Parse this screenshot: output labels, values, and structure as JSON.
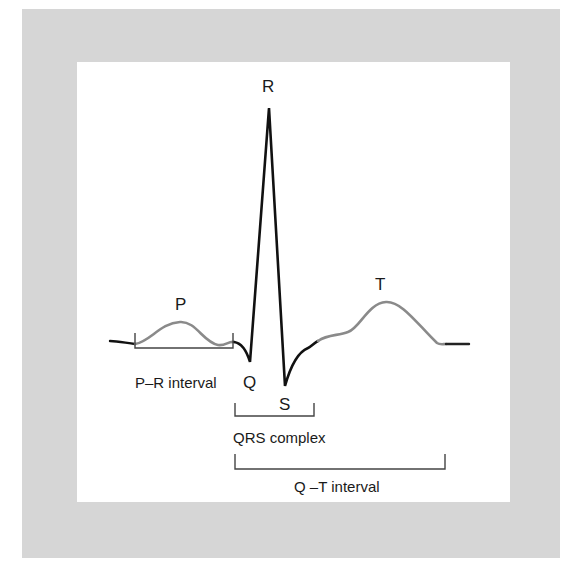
{
  "figure": {
    "colors": {
      "frame": "#d6d6d6",
      "panel": "#ffffff",
      "trace_dark": "#111111",
      "trace_gray": "#8a8a8a",
      "bracket": "#444444",
      "text": "#1a1a1a"
    }
  },
  "waves": {
    "p": "P",
    "q": "Q",
    "r": "R",
    "s": "S",
    "t": "T"
  },
  "intervals": {
    "pr": "P–R interval",
    "qrs": "QRS complex",
    "qt": "Q –T interval"
  }
}
